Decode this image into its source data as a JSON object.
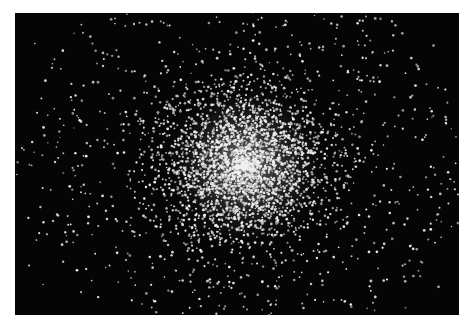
{
  "image": {
    "subject": "globular star cluster",
    "description": "Black-and-white photograph of a dense globular star cluster on a black sky background",
    "background_color": "#050505",
    "page_background": "#ffffff",
    "star_color": "#f0f0f0",
    "frame": {
      "left": 15,
      "top": 13,
      "width": 444,
      "height": 302
    },
    "core_center": {
      "x": 230,
      "y": 152
    },
    "core_radius": 55,
    "halo_radius": 220,
    "star_counts": {
      "core": 2200,
      "halo": 1500,
      "field": 120
    }
  }
}
